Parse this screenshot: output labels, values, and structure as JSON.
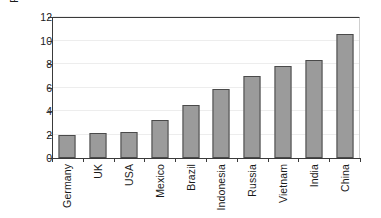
{
  "chart_data": {
    "type": "bar",
    "title": "",
    "subtitle": "",
    "xlabel": "",
    "ylabel": "Percentage",
    "ylim": [
      0,
      12
    ],
    "yticks": [
      0,
      2,
      4,
      6,
      8,
      10,
      12
    ],
    "grid": true,
    "legend": null,
    "orientation": "vertical",
    "bar_color": "#9b9b9b",
    "bar_border_color": "#4a4a4a",
    "axis_color": "#3a3a3a",
    "categories": [
      "Germany",
      "UK",
      "USA",
      "Mexico",
      "Brazil",
      "Indonesia",
      "Russia",
      "Vietnam",
      "India",
      "China"
    ],
    "values": [
      2.0,
      2.15,
      2.25,
      3.25,
      4.5,
      5.85,
      7.0,
      7.85,
      8.35,
      10.55
    ],
    "value_unit": "percent",
    "xtick_labels_rotation": 90
  }
}
